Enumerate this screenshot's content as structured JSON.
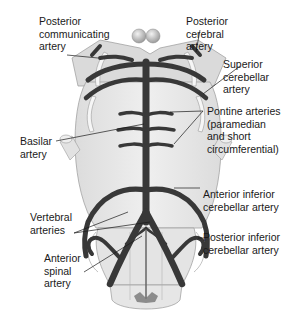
{
  "diagram": {
    "colors": {
      "background": "#ffffff",
      "tissue_light": "#e8e8e8",
      "tissue_mid": "#d2d2d2",
      "tissue_outline": "#9a9a9a",
      "artery": "#3a3a3a",
      "artery_highlight": "#6a6a6a",
      "nerve": "#f4f4f4",
      "leader_line": "#1a1a1a",
      "text": "#1a1a1a"
    },
    "labels": {
      "posterior_communicating": "Posterior\ncommunicating\nartery",
      "posterior_cerebral": "Posterior\ncerebral\nartery",
      "superior_cerebellar": "Superior\ncerebellar\nartery",
      "pontine": "Pontine arteries\n(paramedian\nand short\ncircumferential)",
      "basilar": "Basilar\nartery",
      "anterior_inferior_cerebellar": "Anterior inferior\ncerebellar artery",
      "vertebral": "Vertebral\narteries",
      "posterior_inferior_cerebellar": "Posterior inferior\ncerebellar artery",
      "anterior_spinal": "Anterior\nspinal\nartery"
    }
  }
}
